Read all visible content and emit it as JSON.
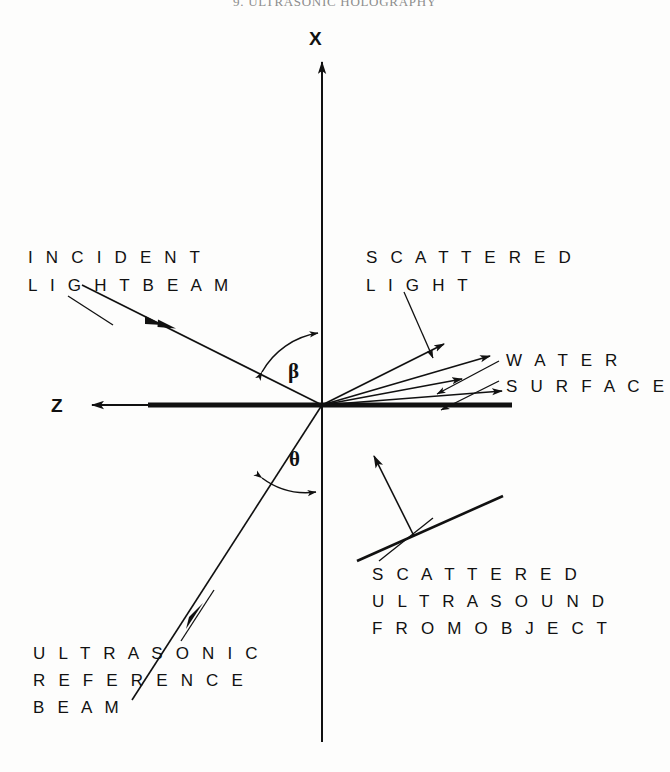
{
  "page": {
    "running_head": "9.  ULTRASONIC  HOLOGRAPHY",
    "background_color": "#fdfdfc",
    "ink_color": "#111111"
  },
  "figure": {
    "type": "technical-line-diagram",
    "origin": {
      "x": 322,
      "y": 405
    },
    "axes": [
      {
        "name": "x-axis",
        "label": "X",
        "label_x": 309,
        "label_y": 45,
        "direction": "vertical",
        "arrow": "up",
        "from_x": 322,
        "from_y": 740,
        "to_x": 322,
        "to_y": 60
      },
      {
        "name": "z-axis",
        "label": "Z",
        "label_x": 51,
        "label_y": 412,
        "direction": "horizontal",
        "arrow": "left",
        "from_x": 322,
        "from_y": 405,
        "to_x": 92,
        "to_y": 405
      }
    ],
    "angles": [
      {
        "name": "beta",
        "symbol": "β",
        "label_x": 288,
        "label_y": 378,
        "between": [
          "incident-light-beam",
          "x-axis"
        ]
      },
      {
        "name": "theta",
        "symbol": "θ",
        "label_x": 289,
        "label_y": 466,
        "between": [
          "ultrasonic-reference-beam",
          "x-axis"
        ]
      }
    ],
    "labels": [
      {
        "name": "incident-light-beam-label",
        "lines": [
          "I N C I D E N T",
          "L I G H T   B E A M"
        ],
        "x": 28,
        "y": 263,
        "line_height": 28
      },
      {
        "name": "scattered-light-label",
        "lines": [
          "S C A T T E R E D",
          "L I G H T"
        ],
        "x": 366,
        "y": 263,
        "line_height": 28
      },
      {
        "name": "water-surface-label",
        "lines": [
          "W A T E R",
          "S U R F A C E"
        ],
        "x": 506,
        "y": 366,
        "line_height": 26
      },
      {
        "name": "scattered-ultrasound-label",
        "lines": [
          "S C A T T E R E D",
          "U L T R A S O U N D",
          "F R O M   O B J E C T"
        ],
        "x": 372,
        "y": 580,
        "line_height": 27
      },
      {
        "name": "ultrasonic-reference-beam-label",
        "lines": [
          "U L T R A S O N I C",
          "R E F E R E N C E",
          "B E A M"
        ],
        "x": 33,
        "y": 659,
        "line_height": 27
      }
    ],
    "elements": {
      "water_surface": {
        "name": "water-surface-line",
        "x1": 148,
        "y1": 405,
        "x2": 512,
        "y2": 405,
        "thickness": 5
      },
      "incident_beam": {
        "name": "incident-light-beam-ray",
        "x1": 82,
        "y1": 285,
        "x2": 322,
        "y2": 405,
        "arrow_at": 0.52
      },
      "reference_beam": {
        "name": "ultrasonic-reference-beam-ray",
        "x1": 132,
        "y1": 700,
        "x2": 322,
        "y2": 405,
        "arrow_at": 0.47
      },
      "scattered_light_rays": [
        {
          "name": "scattered-ray-1",
          "x2": 444,
          "y2": 344
        },
        {
          "name": "scattered-ray-2",
          "x2": 484,
          "y2": 357
        },
        {
          "name": "scattered-ray-3",
          "x2": 460,
          "y2": 379
        },
        {
          "name": "scattered-ray-4",
          "x2": 496,
          "y2": 392
        }
      ],
      "object_bar": {
        "name": "object-bar",
        "x1": 357,
        "y1": 560,
        "x2": 503,
        "y2": 496
      },
      "object_scatter_arrow": {
        "name": "object-scatter-arrow",
        "x1": 413,
        "y1": 535,
        "x2": 374,
        "y2": 455
      }
    },
    "leaders": [
      {
        "name": "leader-incident-light",
        "x1": 70,
        "y1": 297,
        "x2": 117,
        "y2": 327
      },
      {
        "name": "leader-scattered-light",
        "x1": 404,
        "y1": 292,
        "x2": 434,
        "y2": 357
      },
      {
        "name": "leader-water-surface-upper",
        "x1": 497,
        "y1": 362,
        "x2": 437,
        "y2": 395
      },
      {
        "name": "leader-water-surface-lower",
        "x1": 497,
        "y1": 380,
        "x2": 443,
        "y2": 408
      },
      {
        "name": "leader-scattered-ultrasound",
        "x1": 380,
        "y1": 560,
        "x2": 432,
        "y2": 519
      },
      {
        "name": "leader-ultrasonic-reference",
        "x1": 182,
        "y1": 640,
        "x2": 213,
        "y2": 592
      }
    ]
  }
}
